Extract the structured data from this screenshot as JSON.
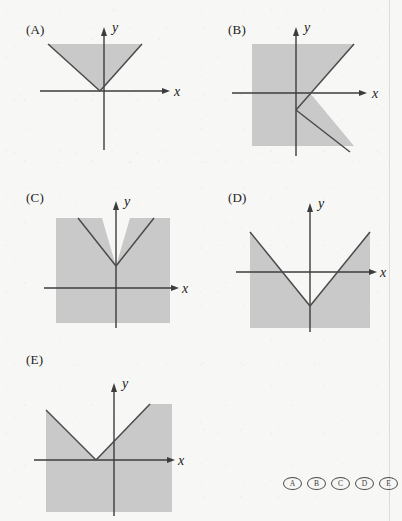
{
  "figure": {
    "type": "multiple-choice-graph-options",
    "shade_color": "#c9c9c9",
    "line_color": "#4a4a4a",
    "axis_color": "#3c3c3c",
    "background_color": "#f7f7f5"
  },
  "panels": [
    {
      "id": "A",
      "label": "(A)",
      "axis_x_label": "x",
      "axis_y_label": "y",
      "description": "V-shaped graph with vertex on the x-axis left of the origin; region inside (above) the V is shaded, bounded above by the top of the frame"
    },
    {
      "id": "B",
      "label": "(B)",
      "axis_x_label": "x",
      "axis_y_label": "y",
      "description": "Sideways V opening to the right with vertex on the y-axis below the origin; region to the left of the V is shaded"
    },
    {
      "id": "C",
      "label": "(C)",
      "axis_x_label": "x",
      "axis_y_label": "y",
      "description": "V-shaped graph with vertex on the y-axis above the x-axis; region below and outside the V is shaded"
    },
    {
      "id": "D",
      "label": "(D)",
      "axis_x_label": "x",
      "axis_y_label": "y",
      "description": "V-shaped graph with vertex on the y-axis below the x-axis; region below and outside the V is shaded"
    },
    {
      "id": "E",
      "label": "(E)",
      "axis_x_label": "x",
      "axis_y_label": "y",
      "description": "V-shaped graph with vertex on the x-axis left of the origin; region below and outside the V is shaded"
    }
  ],
  "answer_bubbles": {
    "options": [
      "A",
      "B",
      "C",
      "D",
      "E"
    ],
    "selected": null
  }
}
